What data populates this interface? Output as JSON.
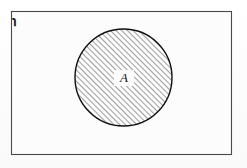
{
  "figure": {
    "kind": "venn-diagram",
    "width": 247,
    "height": 168,
    "background_color": "#fdfdfd"
  },
  "universe": {
    "label": "℩",
    "label_plain": "U",
    "description": "universal set rectangle",
    "border_color": "#4a4a4a",
    "fill_color": "#fcfcfc",
    "x": 11,
    "y": 11,
    "width": 221,
    "height": 144
  },
  "sets": [
    {
      "label": "A",
      "shape": "circle",
      "center_x": 123,
      "center_y": 78,
      "radius": 49,
      "outline_color": "#111111",
      "fill": "diagonal-hatch",
      "hatch_color": "#2b2b2b",
      "hatch_angle_deg": 45,
      "hatch_spacing_px": 4
    }
  ],
  "icons": {
    "hatch_pattern": "diagonal-hatch-pattern",
    "circle": "circle-shape-icon",
    "rectangle": "rectangle-shape-icon"
  }
}
